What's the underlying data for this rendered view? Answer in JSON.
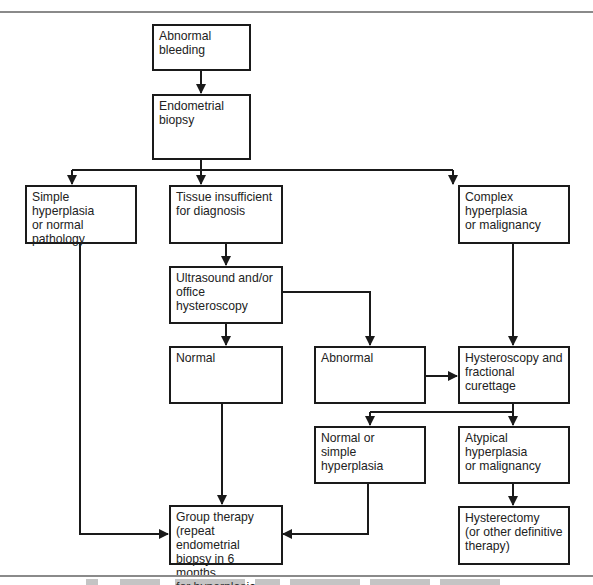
{
  "figure": {
    "type": "flowchart",
    "colors": {
      "line": "#1a1a1a",
      "rule": "#8a8a8a",
      "background": "#ffffff"
    },
    "caption": {
      "legible": false,
      "note": "caption text truncated at bottom edge"
    }
  },
  "nodes": {
    "abnormal_bleeding": {
      "label": "Abnormal bleeding"
    },
    "endometrial_biopsy": {
      "label": "Endometrial biopsy"
    },
    "simple_hyperplasia": {
      "label": "Simple hyperplasia\nor normal pathology"
    },
    "tissue_insufficient": {
      "label": "Tissue insufficient\nfor diagnosis"
    },
    "complex_hyperplasia": {
      "label": "Complex hyperplasia\nor malignancy"
    },
    "ultrasound": {
      "label": "Ultrasound and/or\noffice hysteroscopy"
    },
    "normal": {
      "label": "Normal"
    },
    "abnormal": {
      "label": "Abnormal"
    },
    "hysteroscopy_fc": {
      "label": "Hysteroscopy and\nfractional curettage"
    },
    "normal_or_simple": {
      "label": "Normal or\nsimple hyperplasia"
    },
    "atypical": {
      "label": "Atypical hyperplasia\nor malignancy"
    },
    "group_therapy": {
      "label": "Group therapy\n(repeat endometrial\nbiopsy in 6 months\nfor hyperplasia"
    },
    "hysterectomy": {
      "label": "Hysterectomy\n(or other definitive\ntherapy)"
    }
  },
  "edges": [
    {
      "from": "abnormal_bleeding",
      "to": "endometrial_biopsy"
    },
    {
      "from": "endometrial_biopsy",
      "to": "simple_hyperplasia"
    },
    {
      "from": "endometrial_biopsy",
      "to": "tissue_insufficient"
    },
    {
      "from": "endometrial_biopsy",
      "to": "complex_hyperplasia"
    },
    {
      "from": "tissue_insufficient",
      "to": "ultrasound"
    },
    {
      "from": "ultrasound",
      "to": "normal"
    },
    {
      "from": "ultrasound",
      "to": "abnormal"
    },
    {
      "from": "complex_hyperplasia",
      "to": "hysteroscopy_fc"
    },
    {
      "from": "abnormal",
      "to": "hysteroscopy_fc"
    },
    {
      "from": "hysteroscopy_fc",
      "to": "normal_or_simple"
    },
    {
      "from": "hysteroscopy_fc",
      "to": "atypical"
    },
    {
      "from": "atypical",
      "to": "hysterectomy"
    },
    {
      "from": "simple_hyperplasia",
      "to": "group_therapy"
    },
    {
      "from": "normal",
      "to": "group_therapy"
    },
    {
      "from": "normal_or_simple",
      "to": "group_therapy"
    }
  ]
}
